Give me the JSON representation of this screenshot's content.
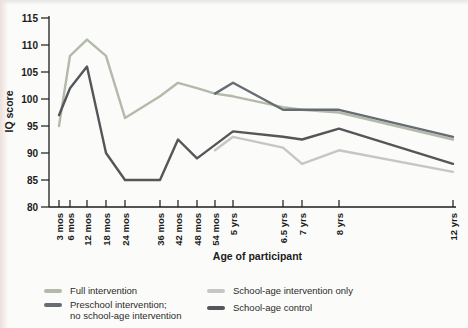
{
  "chart_data": {
    "type": "line",
    "title": "",
    "xlabel": "Age of participant",
    "ylabel": "IQ score",
    "ylim": [
      80,
      115
    ],
    "y_ticks": [
      80,
      85,
      90,
      95,
      100,
      105,
      110,
      115
    ],
    "grid": false,
    "legend_position": "bottom",
    "x_tick_labels": [
      "3 mos",
      "6 mos",
      "12 mos",
      "18 mos",
      "24 mos",
      "36 mos",
      "42 mos",
      "48 mos",
      "54 mos",
      "5 yrs",
      "6.5 yrs",
      "7 yrs",
      "8 yrs",
      "12 yrs"
    ],
    "x_tick_months": [
      3,
      6,
      12,
      18,
      24,
      36,
      42,
      48,
      54,
      60,
      78,
      84,
      96,
      144
    ],
    "series": [
      {
        "name": "Full intervention",
        "color": "#b3baaa",
        "values": [
          95,
          108,
          111,
          108,
          96.5,
          100.5,
          103,
          102,
          101,
          100.5,
          98.5,
          98,
          97.5,
          92.5
        ]
      },
      {
        "name": "Preschool intervention; no school-age intervention",
        "color": "#676c73",
        "values": [
          null,
          null,
          null,
          null,
          null,
          null,
          null,
          null,
          101,
          103,
          98,
          98,
          98,
          93
        ]
      },
      {
        "name": "School-age intervention only",
        "color": "#c6c6c4",
        "values": [
          null,
          null,
          null,
          null,
          null,
          null,
          null,
          null,
          90.5,
          93,
          91,
          88,
          90.5,
          86.5
        ]
      },
      {
        "name": "School-age control",
        "color": "#55565a",
        "values": [
          97,
          102,
          106,
          90,
          85,
          85,
          92.5,
          89,
          91.5,
          94,
          93,
          92.5,
          94.5,
          88
        ]
      }
    ]
  },
  "legend": {
    "items": [
      {
        "series": 0,
        "color": "#b3baaa",
        "lines": [
          "Full intervention"
        ]
      },
      {
        "series": 2,
        "color": "#c6c6c4",
        "lines": [
          "School-age intervention only"
        ]
      },
      {
        "series": 1,
        "color": "#676c73",
        "lines": [
          "Preschool intervention;",
          "no school-age intervention"
        ]
      },
      {
        "series": 3,
        "color": "#55565a",
        "lines": [
          "School-age control"
        ]
      }
    ]
  }
}
